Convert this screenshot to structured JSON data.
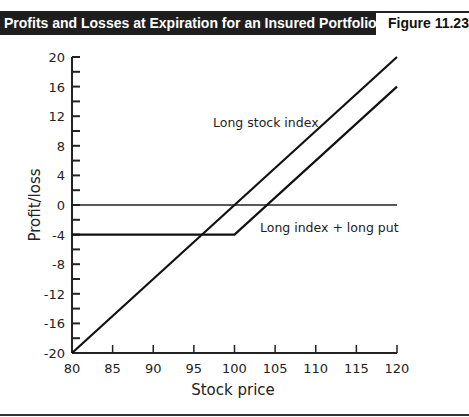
{
  "header": {
    "title": "Profits and Losses at Expiration for an Insured Portfolio",
    "figure_label": "Figure 11.23"
  },
  "chart_data": {
    "type": "line",
    "title": "Profits and Losses at Expiration for an Insured Portfolio",
    "figure": "Figure 11.23",
    "xlabel": "Stock price",
    "ylabel": "Profit/loss",
    "xlim": [
      80,
      120
    ],
    "ylim": [
      -20,
      20
    ],
    "x_ticks": [
      80,
      85,
      90,
      95,
      100,
      105,
      110,
      115,
      120
    ],
    "y_ticks": [
      20,
      16,
      12,
      8,
      4,
      0,
      -4,
      -8,
      -12,
      -16,
      -20
    ],
    "y_minor_step": 2,
    "grid": false,
    "reference_line": {
      "y": 0,
      "x_range": [
        80,
        120
      ]
    },
    "series": [
      {
        "name": "Long stock index",
        "x": [
          80,
          120
        ],
        "y": [
          -20,
          20
        ]
      },
      {
        "name": "Long index + long put",
        "x": [
          80,
          100,
          120
        ],
        "y": [
          -4,
          -4,
          16
        ]
      }
    ],
    "annotations": [
      {
        "text": "Long stock index",
        "x": 97,
        "y": 10
      },
      {
        "text": "Long index + long put",
        "x": 103,
        "y": -3
      }
    ]
  }
}
